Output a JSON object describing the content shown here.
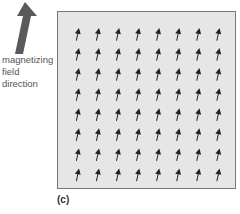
{
  "figure": {
    "label": "(c)",
    "caption_lines": [
      "magnetizing",
      "field",
      "direction"
    ],
    "grid": {
      "rows": 8,
      "cols": 8,
      "arrow_direction": "up (slightly tilted right)"
    },
    "colors": {
      "box_fill": "#e6e6e6",
      "box_border": "#777777",
      "arrow": "#222222",
      "big_arrow": "#555555"
    }
  }
}
